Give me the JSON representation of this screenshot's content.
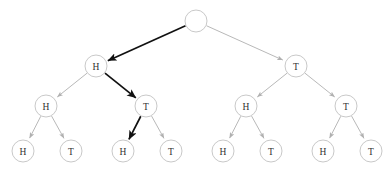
{
  "figure": {
    "name": "coin-flip-probability-tree",
    "background_color": "#ffffff",
    "width": 386,
    "height": 173
  },
  "style": {
    "node_fill": "#ffffff",
    "node_stroke": "#c2c2c2",
    "node_stroke_width": 0.9,
    "node_radius": 11,
    "label_color": "#303030",
    "edge_color_normal": "#b0b0b0",
    "edge_color_highlight": "#111111",
    "edge_width_normal": 0.9,
    "edge_width_highlight": 1.7
  },
  "nodes": [
    {
      "id": "root",
      "label": "",
      "x": 196,
      "y": 21,
      "level": 0,
      "highlighted": false
    },
    {
      "id": "n-H",
      "label": "H",
      "x": 96,
      "y": 66,
      "level": 1,
      "highlighted": true
    },
    {
      "id": "n-T",
      "label": "T",
      "x": 296,
      "y": 66,
      "level": 1,
      "highlighted": false
    },
    {
      "id": "n-HH",
      "label": "H",
      "x": 46,
      "y": 106,
      "level": 2,
      "highlighted": false
    },
    {
      "id": "n-HT",
      "label": "T",
      "x": 146,
      "y": 106,
      "level": 2,
      "highlighted": true
    },
    {
      "id": "n-TH",
      "label": "H",
      "x": 246,
      "y": 106,
      "level": 2,
      "highlighted": false
    },
    {
      "id": "n-TT",
      "label": "T",
      "x": 346,
      "y": 106,
      "level": 2,
      "highlighted": false
    },
    {
      "id": "n-HHH",
      "label": "H",
      "x": 23,
      "y": 151,
      "level": 3,
      "highlighted": false
    },
    {
      "id": "n-HHT",
      "label": "T",
      "x": 71,
      "y": 151,
      "level": 3,
      "highlighted": false
    },
    {
      "id": "n-HTH",
      "label": "H",
      "x": 123,
      "y": 151,
      "level": 3,
      "highlighted": true
    },
    {
      "id": "n-HTT",
      "label": "T",
      "x": 171,
      "y": 151,
      "level": 3,
      "highlighted": false
    },
    {
      "id": "n-THH",
      "label": "H",
      "x": 223,
      "y": 151,
      "level": 3,
      "highlighted": false
    },
    {
      "id": "n-THT",
      "label": "T",
      "x": 271,
      "y": 151,
      "level": 3,
      "highlighted": false
    },
    {
      "id": "n-TTH",
      "label": "H",
      "x": 323,
      "y": 151,
      "level": 3,
      "highlighted": false
    },
    {
      "id": "n-TTT",
      "label": "T",
      "x": 371,
      "y": 151,
      "level": 3,
      "highlighted": false
    }
  ],
  "edges": [
    {
      "id": "e-root-H",
      "from": "root",
      "to": "n-H",
      "highlighted": true
    },
    {
      "id": "e-root-T",
      "from": "root",
      "to": "n-T",
      "highlighted": false
    },
    {
      "id": "e-H-HH",
      "from": "n-H",
      "to": "n-HH",
      "highlighted": false
    },
    {
      "id": "e-H-HT",
      "from": "n-H",
      "to": "n-HT",
      "highlighted": true
    },
    {
      "id": "e-T-TH",
      "from": "n-T",
      "to": "n-TH",
      "highlighted": false
    },
    {
      "id": "e-T-TT",
      "from": "n-T",
      "to": "n-TT",
      "highlighted": false
    },
    {
      "id": "e-HH-HHH",
      "from": "n-HH",
      "to": "n-HHH",
      "highlighted": false
    },
    {
      "id": "e-HH-HHT",
      "from": "n-HH",
      "to": "n-HHT",
      "highlighted": false
    },
    {
      "id": "e-HT-HTH",
      "from": "n-HT",
      "to": "n-HTH",
      "highlighted": true
    },
    {
      "id": "e-HT-HTT",
      "from": "n-HT",
      "to": "n-HTT",
      "highlighted": false
    },
    {
      "id": "e-TH-THH",
      "from": "n-TH",
      "to": "n-THH",
      "highlighted": false
    },
    {
      "id": "e-TH-THT",
      "from": "n-TH",
      "to": "n-THT",
      "highlighted": false
    },
    {
      "id": "e-TT-TTH",
      "from": "n-TT",
      "to": "n-TTH",
      "highlighted": false
    },
    {
      "id": "e-TT-TTT",
      "from": "n-TT",
      "to": "n-TTT",
      "highlighted": false
    }
  ]
}
